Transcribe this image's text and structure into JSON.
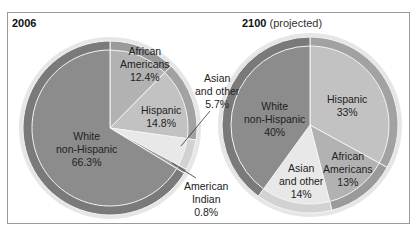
{
  "chart_data": [
    {
      "type": "pie",
      "title": "2006",
      "labels": [
        "African Americans",
        "Hispanic",
        "Asian and other",
        "American Indian",
        "White non-Hispanic"
      ],
      "values": [
        12.4,
        14.8,
        5.7,
        0.8,
        66.3
      ],
      "display": [
        "African\nAmericans\n12.4%",
        "Hispanic\n14.8%",
        "Asian\nand other\n5.7%",
        "American\nIndian\n0.8%",
        "White\nnon-Hispanic\n66.3%"
      ]
    },
    {
      "type": "pie",
      "title": "2100",
      "subtitle": "(projected)",
      "labels": [
        "Hispanic",
        "African Americans",
        "Asian and other",
        "White non-Hispanic"
      ],
      "values": [
        33,
        13,
        14,
        40
      ],
      "display": [
        "Hispanic\n33%",
        "African\nAmericans\n13%",
        "Asian\nand other\n14%",
        "White\nnon-Hispanic\n40%"
      ]
    }
  ],
  "titles": {
    "left": "2006",
    "right_bold": "2100",
    "right_rest": "(projected)"
  },
  "labels": {
    "l_afr": [
      "African",
      "Americans",
      "12.4%"
    ],
    "l_his": [
      "Hispanic",
      "14.8%"
    ],
    "l_asi": [
      "Asian",
      "and other",
      "5.7%"
    ],
    "l_ind": [
      "American",
      "Indian",
      "0.8%"
    ],
    "l_wht": [
      "White",
      "non-Hispanic",
      "66.3%"
    ],
    "r_his": [
      "Hispanic",
      "33%"
    ],
    "r_afr": [
      "African",
      "Americans",
      "13%"
    ],
    "r_asi": [
      "Asian",
      "and other",
      "14%"
    ],
    "r_wht": [
      "White",
      "non-Hispanic",
      "40%"
    ]
  },
  "colors": {
    "white_nh": "#8c8c8c",
    "afr": "#b2b2b2",
    "his": "#c2c2c2",
    "asi": "#e8e8e8",
    "ind": "#a0a0a0",
    "rim": "#7a7a7a",
    "rim_light": "#a8a8a8"
  }
}
